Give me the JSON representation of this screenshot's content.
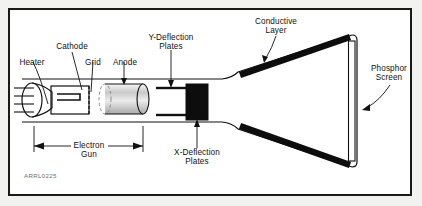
{
  "figure": {
    "id_text": "ARRL0225",
    "background_color": "#ffffff",
    "page_color": "#f2f2f0",
    "border_color": "#1a1a1a",
    "ink_color": "#111111",
    "conductive_layer_color": "#0d0d0d",
    "xplates_color": "#0d0d0d"
  },
  "labels": {
    "heater": "Heater",
    "cathode": "Cathode",
    "grid": "Grid",
    "anode": "Anode",
    "y_plates_line1": "Y-Deflection",
    "y_plates_line2": "Plates",
    "x_plates_line1": "X-Deflection",
    "x_plates_line2": "Plates",
    "conductive_line1": "Conductive",
    "conductive_line2": "Layer",
    "phosphor_line1": "Phosphor",
    "phosphor_line2": "Screen",
    "electron_gun_line1": "Electron",
    "electron_gun_line2": "Gun"
  }
}
